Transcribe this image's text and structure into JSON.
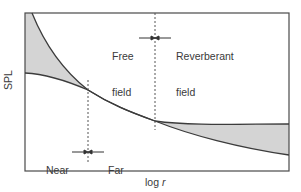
{
  "diagram": {
    "y_axis_label": "SPL",
    "x_axis_label_prefix": "log ",
    "x_axis_label_var": "r",
    "annotations": {
      "free_field": {
        "line1": "Free",
        "line2": "field"
      },
      "reverberant_field": {
        "line1": "Reverberant",
        "line2": "field"
      },
      "near_field": {
        "line1": "Near",
        "line2": "field"
      },
      "far_field": {
        "line1": "Far",
        "line2": "field"
      }
    },
    "colors": {
      "frame": "#4a4a4a",
      "curve": "#3c3c3c",
      "shade": "#d4d4d4",
      "dashed": "#555555",
      "background": "#ffffff"
    }
  }
}
